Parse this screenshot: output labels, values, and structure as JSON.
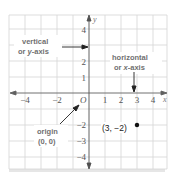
{
  "diagram": {
    "type": "coordinate-plane",
    "x_range": [
      -4,
      4
    ],
    "y_range": [
      -4,
      4
    ],
    "axis_labels": {
      "x": "x",
      "y": "y"
    },
    "x_ticks": [
      "−4",
      "−2",
      "1",
      "2",
      "3",
      "4"
    ],
    "y_ticks": [
      "4",
      "2",
      "1",
      "−2",
      "−3",
      "−4"
    ],
    "origin_symbol": "O",
    "annotations": {
      "vertical_line1": "vertical",
      "vertical_line2_prefix": "or ",
      "vertical_line2_var": "y",
      "vertical_line2_suffix": "-axis",
      "horizontal_line1": "horizontal",
      "horizontal_line2_prefix": "or ",
      "horizontal_line2_var": "x",
      "horizontal_line2_suffix": "-axis",
      "origin_line1": "origin",
      "origin_line2": "(0, 0)"
    },
    "point": {
      "x": 3,
      "y": -2,
      "label": "(3, −2)"
    },
    "colors": {
      "grid": "#d0d0d0",
      "axis": "#505050",
      "text": "#707070",
      "point": "#111111"
    }
  }
}
